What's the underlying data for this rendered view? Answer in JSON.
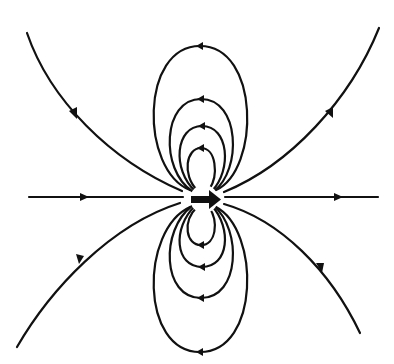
{
  "diagram": {
    "type": "magnetic-dipole-field-lines",
    "background_color": "#ffffff",
    "line_color": "#111111",
    "dipole": {
      "symbol": "arrow-right",
      "center": [
        204,
        199
      ],
      "label": ""
    },
    "field_lines": {
      "axial": {
        "direction": "left-to-right",
        "y": 197
      },
      "outer_curves": [
        {
          "name": "top-left",
          "direction": "toward-dipole"
        },
        {
          "name": "top-right",
          "direction": "away-from-dipole"
        },
        {
          "name": "bottom-left",
          "direction": "toward-dipole"
        },
        {
          "name": "bottom-right",
          "direction": "away-from-dipole"
        }
      ],
      "top_loops": {
        "count": 4,
        "arrow_direction": "right-to-left"
      },
      "bottom_loops": {
        "count": 4,
        "arrow_direction": "right-to-left"
      }
    }
  }
}
